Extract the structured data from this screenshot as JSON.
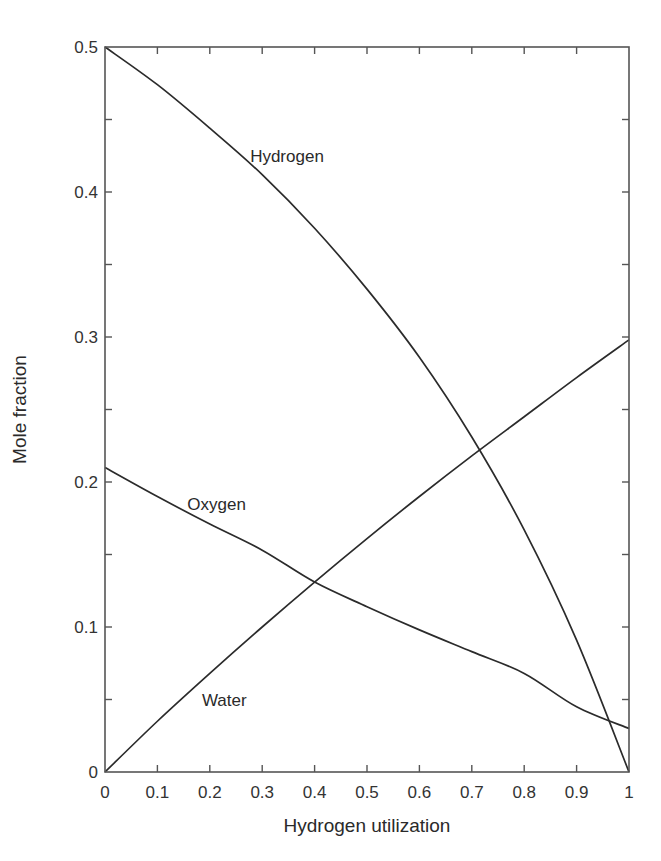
{
  "chart_data": {
    "type": "line",
    "title": "",
    "xlabel": "Hydrogen utilization",
    "ylabel": "Mole fraction",
    "xlim": [
      0,
      1
    ],
    "ylim": [
      0,
      0.5
    ],
    "grid": false,
    "legend": "inline labels on curves",
    "x_ticks": [
      0,
      0.1,
      0.2,
      0.3,
      0.4,
      0.5,
      0.6,
      0.7,
      0.8,
      0.9,
      1
    ],
    "x_tick_labels": [
      "0",
      "0.1",
      "0.2",
      "0.3",
      "0.4",
      "0.5",
      "0.6",
      "0.7",
      "0.8",
      "0.9",
      "1"
    ],
    "y_ticks_major": [
      0,
      0.1,
      0.2,
      0.3,
      0.4,
      0.5
    ],
    "y_tick_labels": [
      "0",
      "0.1",
      "0.2",
      "0.3",
      "0.4",
      "0.5"
    ],
    "y_ticks_minor": [
      0.05,
      0.15,
      0.25,
      0.35,
      0.45
    ],
    "x": [
      0,
      0.1,
      0.2,
      0.3,
      0.4,
      0.5,
      0.6,
      0.7,
      0.8,
      0.9,
      1.0
    ],
    "series": [
      {
        "name": "Hydrogen",
        "values": [
          0.5,
          0.474,
          0.444,
          0.412,
          0.375,
          0.333,
          0.286,
          0.231,
          0.167,
          0.091,
          0.0
        ],
        "label_pos": [
          0.277,
          0.425
        ]
      },
      {
        "name": "Oxygen",
        "values": [
          0.21,
          0.19,
          0.171,
          0.153,
          0.131,
          0.114,
          0.098,
          0.083,
          0.068,
          0.045,
          0.03
        ],
        "label_pos": [
          0.157,
          0.185
        ]
      },
      {
        "name": "Water",
        "values": [
          0.0,
          0.035,
          0.068,
          0.1,
          0.131,
          0.161,
          0.19,
          0.218,
          0.245,
          0.272,
          0.298
        ],
        "label_pos": [
          0.185,
          0.05
        ]
      }
    ],
    "annotations": [
      {
        "text": "Hydrogen",
        "x": 0.277,
        "y": 0.425
      },
      {
        "text": "Oxygen",
        "x": 0.157,
        "y": 0.185
      },
      {
        "text": "Water",
        "x": 0.185,
        "y": 0.05
      }
    ],
    "intersections": [
      {
        "between": [
          "Oxygen",
          "Water"
        ],
        "x": 0.4,
        "y": 0.131
      },
      {
        "between": [
          "Hydrogen",
          "Water"
        ],
        "x": 0.714,
        "y": 0.223
      },
      {
        "between": [
          "Hydrogen",
          "Oxygen"
        ],
        "x": 0.962,
        "y": 0.036
      }
    ]
  }
}
